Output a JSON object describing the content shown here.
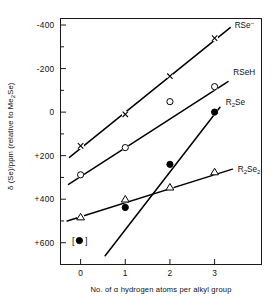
{
  "chart_data": {
    "type": "line",
    "title": "",
    "xlabel": "No. of α hydrogen atoms per alkyl group",
    "ylabel": "δ (Se)/ppm (relative to Me₂Se)",
    "ylabel_parts": {
      "delta": "δ",
      "main": " (Se)/ppm (relative to Me",
      "sub": "2",
      "tail": "Se)"
    },
    "x": [
      0,
      1,
      2,
      3
    ],
    "xtick_labels": [
      "0",
      "1",
      "2",
      "3"
    ],
    "xlim": [
      -0.45,
      4.05
    ],
    "ytick_labels": [
      "-400",
      "-200",
      "0",
      "+200",
      "+400",
      "+600"
    ],
    "ytick_values": [
      -400,
      -200,
      0,
      200,
      400,
      600
    ],
    "yminor_values": [
      -300,
      -100,
      100,
      300,
      500
    ],
    "ylim": [
      -430,
      700
    ],
    "y_axis_inverted": true,
    "grid": false,
    "legend_position": "inline-right-of-line-end",
    "series": [
      {
        "name": "RSe⁻",
        "label_main": "RSe",
        "label_sup": "−",
        "label_sub": "",
        "marker": "cross",
        "x": [
          0,
          1,
          2,
          3
        ],
        "values": [
          155,
          10,
          -165,
          -340
        ],
        "line_x": [
          -0.25,
          3.35
        ],
        "line_values": [
          208,
          -388
        ],
        "label_at": {
          "x": 3.45,
          "y": -398
        }
      },
      {
        "name": "RSeH",
        "label_main": "RSeH",
        "label_sup": "",
        "label_sub": "",
        "marker": "open-circle",
        "x": [
          0,
          1,
          2,
          3
        ],
        "values": [
          288,
          163,
          -48,
          -117
        ],
        "line_x": [
          -0.27,
          3.3
        ],
        "line_values": [
          332,
          -140
        ],
        "label_at": {
          "x": 3.42,
          "y": -185
        }
      },
      {
        "name": "R₂Se",
        "label_main": "R",
        "label_sub": "2",
        "label_tail": "Se",
        "label_sup": "",
        "marker": "filled-circle",
        "x": [
          1,
          2,
          3
        ],
        "values": [
          438,
          240,
          0
        ],
        "line_x": [
          0.55,
          3.12
        ],
        "line_values": [
          660,
          -22
        ],
        "label_at": {
          "x": 3.25,
          "y": -48
        },
        "extra_point": {
          "note": "bracketed value at x = 0",
          "x": 0,
          "y": 590,
          "marker": "bracketed-filled-circle",
          "display": "[●]"
        }
      },
      {
        "name": "R₂Se₂",
        "label_main": "R",
        "label_sub": "2",
        "label_tail": "Se",
        "label_sub2": "2",
        "label_sup": "",
        "marker": "open-triangle",
        "x": [
          0,
          1,
          2,
          3
        ],
        "values": [
          482,
          400,
          345,
          275
        ],
        "line_x": [
          -0.3,
          3.4
        ],
        "line_values": [
          500,
          262
        ],
        "label_at": {
          "x": 3.52,
          "y": 262
        }
      }
    ]
  },
  "figure": {
    "axis_color": "#1a1a1a",
    "line_color": "#000000",
    "background": "#ffffff",
    "marker_fill_open": "#ffffff"
  }
}
